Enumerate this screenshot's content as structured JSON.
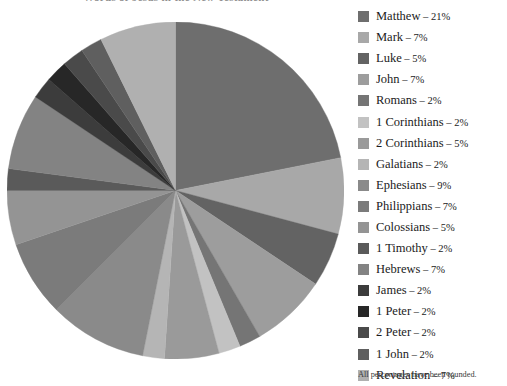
{
  "title": "Words of Jesus in the New Testament",
  "footnote": "All percentages have been rounded.",
  "legend": {
    "separator": "–",
    "percent_suffix": "%"
  },
  "chart_data": {
    "type": "pie",
    "title": "Words of Jesus in the New Testament",
    "unit": "%",
    "start_angle_deg": 0,
    "direction": "clockwise",
    "total": 100,
    "note": "All percentages have been rounded.",
    "legend_position": "right",
    "grid": false,
    "categories": [
      "Matthew",
      "Mark",
      "Luke",
      "John",
      "Romans",
      "1 Corinthians",
      "2 Corinthians",
      "Galatians",
      "Ephesians",
      "Philippians",
      "Colossians",
      "1 Timothy",
      "Hebrews",
      "James",
      "1 Peter",
      "2 Peter",
      "1 John",
      "Revelation"
    ],
    "values": [
      21,
      7,
      5,
      7,
      2,
      2,
      5,
      2,
      9,
      7,
      5,
      2,
      7,
      2,
      2,
      2,
      2,
      7
    ],
    "slices": [
      {
        "label": "Matthew",
        "value": 21,
        "color": "#6e6e6e"
      },
      {
        "label": "Mark",
        "value": 7,
        "color": "#a8a8a8"
      },
      {
        "label": "Luke",
        "value": 5,
        "color": "#636363"
      },
      {
        "label": "John",
        "value": 7,
        "color": "#9d9d9d"
      },
      {
        "label": "Romans",
        "value": 2,
        "color": "#757575"
      },
      {
        "label": "1 Corinthians",
        "value": 2,
        "color": "#c2c2c2"
      },
      {
        "label": "2 Corinthians",
        "value": 5,
        "color": "#9a9a9a"
      },
      {
        "label": "Galatians",
        "value": 2,
        "color": "#b5b5b5"
      },
      {
        "label": "Ephesians",
        "value": 9,
        "color": "#8a8a8a"
      },
      {
        "label": "Philippians",
        "value": 7,
        "color": "#7b7b7b"
      },
      {
        "label": "Colossians",
        "value": 5,
        "color": "#949494"
      },
      {
        "label": "1 Timothy",
        "value": 2,
        "color": "#5a5a5a"
      },
      {
        "label": "Hebrews",
        "value": 7,
        "color": "#838383"
      },
      {
        "label": "James",
        "value": 2,
        "color": "#3c3c3c"
      },
      {
        "label": "1 Peter",
        "value": 2,
        "color": "#272727"
      },
      {
        "label": "2 Peter",
        "value": 2,
        "color": "#4a4a4a"
      },
      {
        "label": "1 John",
        "value": 2,
        "color": "#5f5f5f"
      },
      {
        "label": "Revelation",
        "value": 7,
        "color": "#b0b0b0"
      }
    ]
  }
}
